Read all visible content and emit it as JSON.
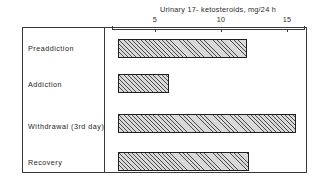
{
  "chart_data": {
    "type": "bar",
    "orientation": "horizontal",
    "title": "Urinary 17- ketosteroids, mg/24 h",
    "xlabel": "",
    "ylabel": "",
    "categories": [
      "Preaddiction",
      "Addiction",
      "Withdrawal  (3rd day)",
      "Recovery"
    ],
    "values": [
      9.8,
      3.9,
      13.5,
      9.9
    ],
    "tick_labels": [
      "5",
      "10",
      "15"
    ],
    "tick_values": [
      5,
      10,
      15
    ],
    "xlim": [
      0,
      17
    ],
    "grid": false,
    "legend": null,
    "series": [
      {
        "name": "Urinary 17-ketosteroids",
        "values": [
          9.8,
          3.9,
          13.5,
          9.9
        ]
      }
    ],
    "bar_fill": "#d9d9d9",
    "bar_hatch": "diagonal",
    "bar_edge_color": "#1f1f1f",
    "axis_color": "#3a3a3a"
  },
  "axis": {
    "title": "Urinary 17- ketosteroids, mg/24 h",
    "ticks": [
      {
        "label": "5",
        "value": 5
      },
      {
        "label": "10",
        "value": 10
      },
      {
        "label": "15",
        "value": 15
      }
    ]
  },
  "rows": [
    {
      "label": "Preaddiction",
      "value": 9.8
    },
    {
      "label": "Addiction",
      "value": 3.9
    },
    {
      "label": "Withdrawal  (3rd day)",
      "value": 13.5
    },
    {
      "label": "Recovery",
      "value": 9.9
    }
  ]
}
